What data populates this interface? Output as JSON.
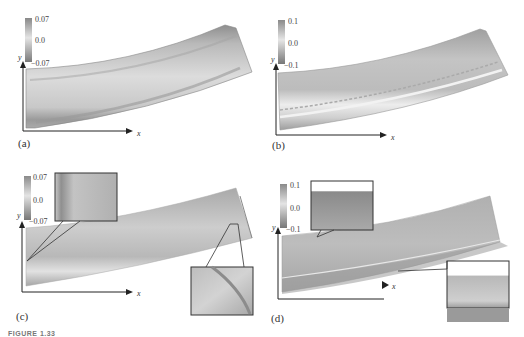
{
  "figure": {
    "caption_fragment": "FIGURE 1.33",
    "panels": [
      {
        "id": "a",
        "label": "(a)",
        "colorbar": {
          "max": "0.07",
          "mid": "0.0",
          "min": "−0.07"
        },
        "axes": {
          "x": "x",
          "y": "y"
        },
        "insets": 0
      },
      {
        "id": "b",
        "label": "(b)",
        "colorbar": {
          "max": "0.1",
          "mid": "0.0",
          "min": "−0.1"
        },
        "axes": {
          "x": "x",
          "y": "y"
        },
        "insets": 0
      },
      {
        "id": "c",
        "label": "(c)",
        "colorbar": {
          "max": "0.07",
          "mid": "0.0",
          "min": "−0.07"
        },
        "axes": {
          "x": "x",
          "y": "y"
        },
        "insets": 2
      },
      {
        "id": "d",
        "label": "(d)",
        "colorbar": {
          "max": "0.1",
          "mid": "0.0",
          "min": "−0.1"
        },
        "axes": {
          "x": "x",
          "y": "y"
        },
        "insets": 2
      }
    ]
  },
  "colors": {
    "beam_light": "#d8d8d8",
    "beam_mid": "#b5b5b5",
    "beam_dark": "#8c8c8c",
    "axis": "#222222",
    "inset_border": "#333333"
  }
}
